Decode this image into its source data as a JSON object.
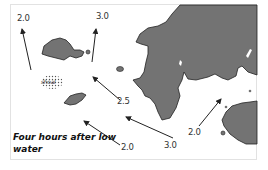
{
  "figure": {
    "caption": "Four hours after low water",
    "land_color": "#737373",
    "stroke_color": "#222222",
    "arrows": [
      {
        "label": "2.0",
        "position": "top-left"
      },
      {
        "label": "3.0",
        "position": "top-center"
      },
      {
        "label": "2.5",
        "position": "center"
      },
      {
        "label": "3.0",
        "position": "bottom-center"
      },
      {
        "label": "2.0",
        "position": "bottom-left"
      },
      {
        "label": "2.0",
        "position": "bottom-right"
      }
    ],
    "shoal_label": "shoal"
  }
}
